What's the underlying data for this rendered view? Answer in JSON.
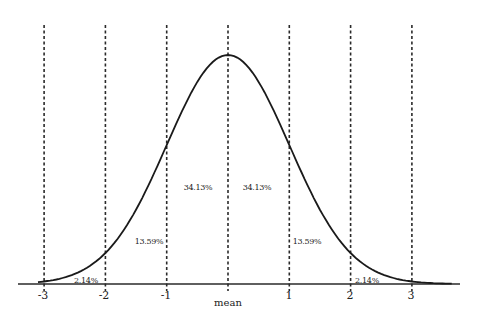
{
  "chart_data": {
    "type": "line",
    "title": "",
    "xlabel": "mean",
    "ylabel": "",
    "xlim": [
      -3.4,
      3.8
    ],
    "grid": false,
    "legend": null,
    "x_ticks": [
      "-3",
      "-2",
      "-1",
      "mean",
      "1",
      "2",
      "3"
    ],
    "tick_labels": [
      "-3",
      "-2",
      "-1",
      "1",
      "2",
      "3"
    ],
    "vertical_dashed_lines_at": [
      -3,
      -2,
      -1,
      0,
      1,
      2,
      3
    ],
    "series": [
      {
        "name": "normal distribution curve",
        "function": "standard normal pdf",
        "mean": 0,
        "sd": 1
      }
    ],
    "region_annotations": [
      {
        "range": [
          -3,
          -2
        ],
        "label": "2.14%"
      },
      {
        "range": [
          -2,
          -1
        ],
        "label": "13.59%"
      },
      {
        "range": [
          -1,
          0
        ],
        "label": "34.13%"
      },
      {
        "range": [
          0,
          1
        ],
        "label": "34.13%"
      },
      {
        "range": [
          1,
          2
        ],
        "label": "13.59%"
      },
      {
        "range": [
          2,
          3
        ],
        "label": "2.14%"
      }
    ]
  },
  "labels": {
    "ticks": [
      "-3",
      "-2",
      "-1",
      "1",
      "2",
      "3"
    ],
    "mean": "mean",
    "pct": [
      "2.14%",
      "13.59%",
      "34.13%",
      "34.13%",
      "13.59%",
      "2.14%"
    ]
  }
}
